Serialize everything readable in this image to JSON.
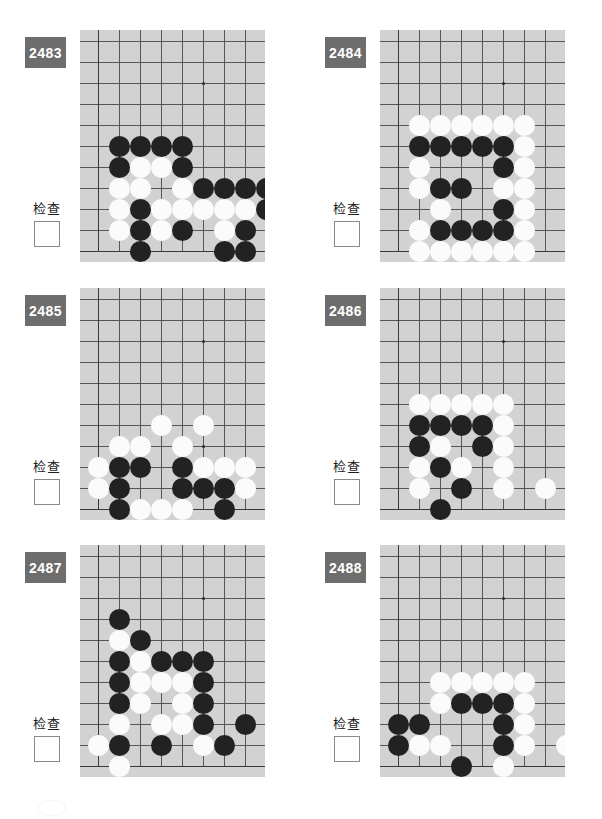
{
  "page": {
    "board_background": "#d2d2d2",
    "badge_color": "#6d6d6d",
    "black_color": "#222222",
    "white_color": "#fbfbfb",
    "line_color": "#575757"
  },
  "labels": {
    "check": "检查"
  },
  "board_geometry": {
    "cols": 9,
    "rows": 9,
    "cell": 21,
    "origin_x": 18,
    "origin_y": 11,
    "star_col": 5,
    "star_row": 2
  },
  "problems": [
    {
      "number": "2483",
      "check_label": "检查",
      "checkbox_checked": false,
      "stones": [
        {
          "c": 1,
          "r": 5,
          "color": "b"
        },
        {
          "c": 2,
          "r": 5,
          "color": "b"
        },
        {
          "c": 3,
          "r": 5,
          "color": "b"
        },
        {
          "c": 4,
          "r": 5,
          "color": "b"
        },
        {
          "c": 1,
          "r": 6,
          "color": "b"
        },
        {
          "c": 2,
          "r": 6,
          "color": "w"
        },
        {
          "c": 3,
          "r": 6,
          "color": "w"
        },
        {
          "c": 4,
          "r": 6,
          "color": "b"
        },
        {
          "c": 1,
          "r": 7,
          "color": "w"
        },
        {
          "c": 2,
          "r": 7,
          "color": "w"
        },
        {
          "c": 4,
          "r": 7,
          "color": "w"
        },
        {
          "c": 5,
          "r": 7,
          "color": "b"
        },
        {
          "c": 6,
          "r": 7,
          "color": "b"
        },
        {
          "c": 7,
          "r": 7,
          "color": "b"
        },
        {
          "c": 8,
          "r": 7,
          "color": "b"
        },
        {
          "c": 1,
          "r": 8,
          "color": "w"
        },
        {
          "c": 2,
          "r": 8,
          "color": "b"
        },
        {
          "c": 3,
          "r": 8,
          "color": "w"
        },
        {
          "c": 4,
          "r": 8,
          "color": "w"
        },
        {
          "c": 5,
          "r": 8,
          "color": "w"
        },
        {
          "c": 6,
          "r": 8,
          "color": "w"
        },
        {
          "c": 7,
          "r": 8,
          "color": "w"
        },
        {
          "c": 8,
          "r": 8,
          "color": "b"
        },
        {
          "c": 1,
          "r": 9,
          "color": "w"
        },
        {
          "c": 2,
          "r": 9,
          "color": "b"
        },
        {
          "c": 3,
          "r": 9,
          "color": "w"
        },
        {
          "c": 4,
          "r": 9,
          "color": "b"
        },
        {
          "c": 6,
          "r": 9,
          "color": "w"
        },
        {
          "c": 7,
          "r": 9,
          "color": "b"
        },
        {
          "c": 2,
          "r": 10,
          "color": "b"
        },
        {
          "c": 6,
          "r": 10,
          "color": "b"
        },
        {
          "c": 7,
          "r": 10,
          "color": "b"
        }
      ]
    },
    {
      "number": "2484",
      "check_label": "检查",
      "checkbox_checked": false,
      "stones": [
        {
          "c": 1,
          "r": 4,
          "color": "w"
        },
        {
          "c": 2,
          "r": 4,
          "color": "w"
        },
        {
          "c": 3,
          "r": 4,
          "color": "w"
        },
        {
          "c": 4,
          "r": 4,
          "color": "w"
        },
        {
          "c": 5,
          "r": 4,
          "color": "w"
        },
        {
          "c": 6,
          "r": 4,
          "color": "w"
        },
        {
          "c": 1,
          "r": 5,
          "color": "b"
        },
        {
          "c": 2,
          "r": 5,
          "color": "b"
        },
        {
          "c": 3,
          "r": 5,
          "color": "b"
        },
        {
          "c": 4,
          "r": 5,
          "color": "b"
        },
        {
          "c": 5,
          "r": 5,
          "color": "b"
        },
        {
          "c": 6,
          "r": 5,
          "color": "w"
        },
        {
          "c": 1,
          "r": 6,
          "color": "w"
        },
        {
          "c": 5,
          "r": 6,
          "color": "b"
        },
        {
          "c": 6,
          "r": 6,
          "color": "w"
        },
        {
          "c": 1,
          "r": 7,
          "color": "w"
        },
        {
          "c": 2,
          "r": 7,
          "color": "b"
        },
        {
          "c": 3,
          "r": 7,
          "color": "b"
        },
        {
          "c": 5,
          "r": 7,
          "color": "w"
        },
        {
          "c": 6,
          "r": 7,
          "color": "w"
        },
        {
          "c": 2,
          "r": 8,
          "color": "w"
        },
        {
          "c": 5,
          "r": 8,
          "color": "b"
        },
        {
          "c": 6,
          "r": 8,
          "color": "w"
        },
        {
          "c": 1,
          "r": 9,
          "color": "w"
        },
        {
          "c": 2,
          "r": 9,
          "color": "b"
        },
        {
          "c": 3,
          "r": 9,
          "color": "b"
        },
        {
          "c": 4,
          "r": 9,
          "color": "b"
        },
        {
          "c": 5,
          "r": 9,
          "color": "b"
        },
        {
          "c": 6,
          "r": 9,
          "color": "w"
        },
        {
          "c": 1,
          "r": 10,
          "color": "w"
        },
        {
          "c": 2,
          "r": 10,
          "color": "w"
        },
        {
          "c": 3,
          "r": 10,
          "color": "w"
        },
        {
          "c": 4,
          "r": 10,
          "color": "w"
        },
        {
          "c": 5,
          "r": 10,
          "color": "w"
        },
        {
          "c": 6,
          "r": 10,
          "color": "w"
        }
      ]
    },
    {
      "number": "2485",
      "check_label": "检查",
      "checkbox_checked": false,
      "stones": [
        {
          "c": 3,
          "r": 6,
          "color": "w"
        },
        {
          "c": 5,
          "r": 6,
          "color": "w"
        },
        {
          "c": 1,
          "r": 7,
          "color": "w"
        },
        {
          "c": 2,
          "r": 7,
          "color": "w"
        },
        {
          "c": 4,
          "r": 7,
          "color": "w"
        },
        {
          "c": 0,
          "r": 8,
          "color": "w"
        },
        {
          "c": 1,
          "r": 8,
          "color": "b"
        },
        {
          "c": 2,
          "r": 8,
          "color": "b"
        },
        {
          "c": 4,
          "r": 8,
          "color": "b"
        },
        {
          "c": 5,
          "r": 8,
          "color": "w"
        },
        {
          "c": 6,
          "r": 8,
          "color": "w"
        },
        {
          "c": 7,
          "r": 8,
          "color": "w"
        },
        {
          "c": 0,
          "r": 9,
          "color": "w"
        },
        {
          "c": 1,
          "r": 9,
          "color": "b"
        },
        {
          "c": 4,
          "r": 9,
          "color": "b"
        },
        {
          "c": 5,
          "r": 9,
          "color": "b"
        },
        {
          "c": 6,
          "r": 9,
          "color": "b"
        },
        {
          "c": 7,
          "r": 9,
          "color": "w"
        },
        {
          "c": 1,
          "r": 10,
          "color": "b"
        },
        {
          "c": 2,
          "r": 10,
          "color": "w"
        },
        {
          "c": 3,
          "r": 10,
          "color": "w"
        },
        {
          "c": 4,
          "r": 10,
          "color": "w"
        },
        {
          "c": 6,
          "r": 10,
          "color": "b"
        }
      ]
    },
    {
      "number": "2486",
      "check_label": "检查",
      "checkbox_checked": false,
      "stones": [
        {
          "c": 1,
          "r": 5,
          "color": "w"
        },
        {
          "c": 2,
          "r": 5,
          "color": "w"
        },
        {
          "c": 3,
          "r": 5,
          "color": "w"
        },
        {
          "c": 4,
          "r": 5,
          "color": "w"
        },
        {
          "c": 5,
          "r": 5,
          "color": "w"
        },
        {
          "c": 1,
          "r": 6,
          "color": "b"
        },
        {
          "c": 2,
          "r": 6,
          "color": "b"
        },
        {
          "c": 3,
          "r": 6,
          "color": "b"
        },
        {
          "c": 4,
          "r": 6,
          "color": "b"
        },
        {
          "c": 5,
          "r": 6,
          "color": "w"
        },
        {
          "c": 1,
          "r": 7,
          "color": "b"
        },
        {
          "c": 2,
          "r": 7,
          "color": "w"
        },
        {
          "c": 4,
          "r": 7,
          "color": "b"
        },
        {
          "c": 5,
          "r": 7,
          "color": "w"
        },
        {
          "c": 1,
          "r": 8,
          "color": "w"
        },
        {
          "c": 2,
          "r": 8,
          "color": "b"
        },
        {
          "c": 3,
          "r": 8,
          "color": "w"
        },
        {
          "c": 5,
          "r": 8,
          "color": "w"
        },
        {
          "c": 1,
          "r": 9,
          "color": "w"
        },
        {
          "c": 3,
          "r": 9,
          "color": "b"
        },
        {
          "c": 5,
          "r": 9,
          "color": "w"
        },
        {
          "c": 7,
          "r": 9,
          "color": "w"
        },
        {
          "c": 2,
          "r": 10,
          "color": "b"
        }
      ]
    },
    {
      "number": "2487",
      "check_label": "检查",
      "checkbox_checked": false,
      "stones": [
        {
          "c": 1,
          "r": 3,
          "color": "b"
        },
        {
          "c": 1,
          "r": 4,
          "color": "w"
        },
        {
          "c": 2,
          "r": 4,
          "color": "b"
        },
        {
          "c": 1,
          "r": 5,
          "color": "b"
        },
        {
          "c": 2,
          "r": 5,
          "color": "w"
        },
        {
          "c": 3,
          "r": 5,
          "color": "b"
        },
        {
          "c": 4,
          "r": 5,
          "color": "b"
        },
        {
          "c": 5,
          "r": 5,
          "color": "b"
        },
        {
          "c": 1,
          "r": 6,
          "color": "b"
        },
        {
          "c": 2,
          "r": 6,
          "color": "w"
        },
        {
          "c": 3,
          "r": 6,
          "color": "w"
        },
        {
          "c": 4,
          "r": 6,
          "color": "w"
        },
        {
          "c": 5,
          "r": 6,
          "color": "b"
        },
        {
          "c": 1,
          "r": 7,
          "color": "b"
        },
        {
          "c": 2,
          "r": 7,
          "color": "w"
        },
        {
          "c": 4,
          "r": 7,
          "color": "w"
        },
        {
          "c": 5,
          "r": 7,
          "color": "b"
        },
        {
          "c": 1,
          "r": 8,
          "color": "w"
        },
        {
          "c": 3,
          "r": 8,
          "color": "w"
        },
        {
          "c": 4,
          "r": 8,
          "color": "w"
        },
        {
          "c": 5,
          "r": 8,
          "color": "b"
        },
        {
          "c": 7,
          "r": 8,
          "color": "b"
        },
        {
          "c": 0,
          "r": 9,
          "color": "w"
        },
        {
          "c": 1,
          "r": 9,
          "color": "b"
        },
        {
          "c": 3,
          "r": 9,
          "color": "b"
        },
        {
          "c": 5,
          "r": 9,
          "color": "w"
        },
        {
          "c": 6,
          "r": 9,
          "color": "b"
        },
        {
          "c": 1,
          "r": 10,
          "color": "w"
        }
      ]
    },
    {
      "number": "2488",
      "check_label": "检查",
      "checkbox_checked": false,
      "stones": [
        {
          "c": 2,
          "r": 6,
          "color": "w"
        },
        {
          "c": 3,
          "r": 6,
          "color": "w"
        },
        {
          "c": 4,
          "r": 6,
          "color": "w"
        },
        {
          "c": 5,
          "r": 6,
          "color": "w"
        },
        {
          "c": 6,
          "r": 6,
          "color": "w"
        },
        {
          "c": 2,
          "r": 7,
          "color": "w"
        },
        {
          "c": 3,
          "r": 7,
          "color": "b"
        },
        {
          "c": 4,
          "r": 7,
          "color": "b"
        },
        {
          "c": 5,
          "r": 7,
          "color": "b"
        },
        {
          "c": 6,
          "r": 7,
          "color": "w"
        },
        {
          "c": 0,
          "r": 8,
          "color": "b"
        },
        {
          "c": 1,
          "r": 8,
          "color": "b"
        },
        {
          "c": 5,
          "r": 8,
          "color": "b"
        },
        {
          "c": 6,
          "r": 8,
          "color": "w"
        },
        {
          "c": 0,
          "r": 9,
          "color": "b"
        },
        {
          "c": 1,
          "r": 9,
          "color": "w"
        },
        {
          "c": 2,
          "r": 9,
          "color": "w"
        },
        {
          "c": 5,
          "r": 9,
          "color": "b"
        },
        {
          "c": 6,
          "r": 9,
          "color": "w"
        },
        {
          "c": 8,
          "r": 9,
          "color": "w"
        },
        {
          "c": 3,
          "r": 10,
          "color": "b"
        },
        {
          "c": 5,
          "r": 10,
          "color": "w"
        }
      ]
    }
  ]
}
